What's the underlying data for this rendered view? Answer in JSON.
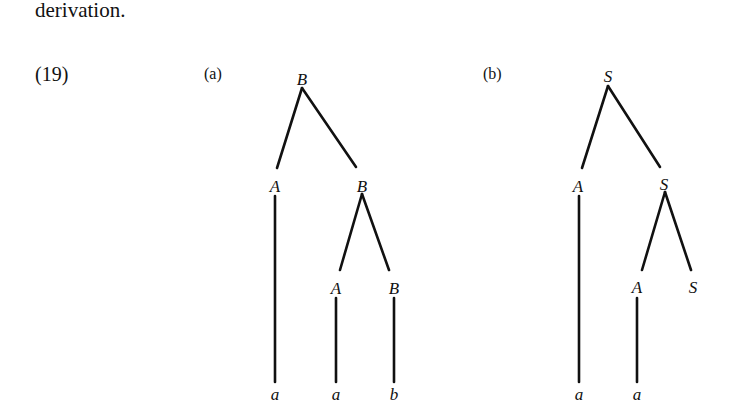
{
  "text": {
    "intro": "derivation.",
    "example_number": "(19)"
  },
  "trees": [
    {
      "label": "(a)",
      "root": "B",
      "nodes": [
        {
          "id": "a_root",
          "label": "B",
          "x": 302,
          "y": 80
        },
        {
          "id": "a_A1",
          "label": "A",
          "x": 275,
          "y": 188
        },
        {
          "id": "a_B1",
          "label": "B",
          "x": 362,
          "y": 188
        },
        {
          "id": "a_A2",
          "label": "A",
          "x": 335,
          "y": 288
        },
        {
          "id": "a_B2",
          "label": "B",
          "x": 394,
          "y": 288
        },
        {
          "id": "a_l1",
          "label": "a",
          "x": 275,
          "y": 396
        },
        {
          "id": "a_l2",
          "label": "a",
          "x": 336,
          "y": 396
        },
        {
          "id": "a_l3",
          "label": "b",
          "x": 394,
          "y": 396
        }
      ]
    },
    {
      "label": "(b)",
      "root": "S",
      "nodes": [
        {
          "id": "b_root",
          "label": "S",
          "x": 608,
          "y": 80
        },
        {
          "id": "b_A1",
          "label": "A",
          "x": 578,
          "y": 188
        },
        {
          "id": "b_S1",
          "label": "S",
          "x": 664,
          "y": 188
        },
        {
          "id": "b_A2",
          "label": "A",
          "x": 637,
          "y": 288
        },
        {
          "id": "b_S2",
          "label": "S",
          "x": 693,
          "y": 288
        },
        {
          "id": "b_l1",
          "label": "a",
          "x": 579,
          "y": 396
        },
        {
          "id": "b_l2",
          "label": "a",
          "x": 637,
          "y": 396
        }
      ]
    }
  ]
}
